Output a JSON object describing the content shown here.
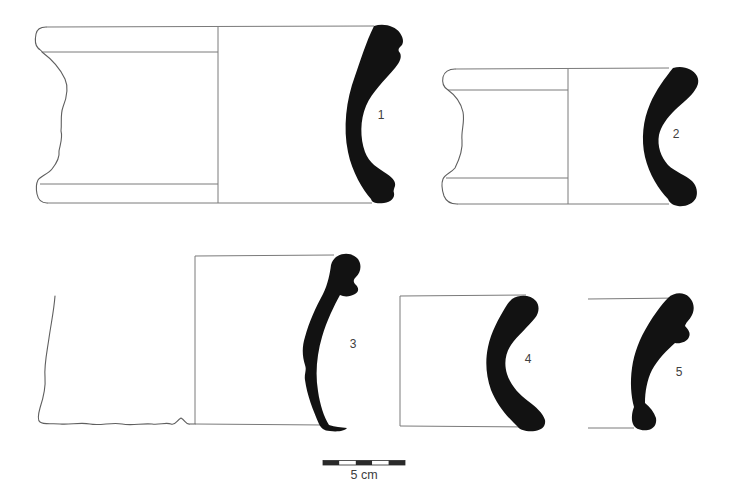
{
  "colors": {
    "background": "#ffffff",
    "section_fill": "#121212",
    "outline": "#5f5f5f",
    "construction_line": "#7a7a7a",
    "label_text": "#404040",
    "scale_dark": "#2a2a2a",
    "scale_light": "#ffffff"
  },
  "vessels": [
    {
      "label": "1"
    },
    {
      "label": "2"
    },
    {
      "label": "3"
    },
    {
      "label": "4"
    },
    {
      "label": "5"
    }
  ],
  "scale_bar": {
    "label": "5 cm",
    "length_cm": 5,
    "segments": 5
  }
}
